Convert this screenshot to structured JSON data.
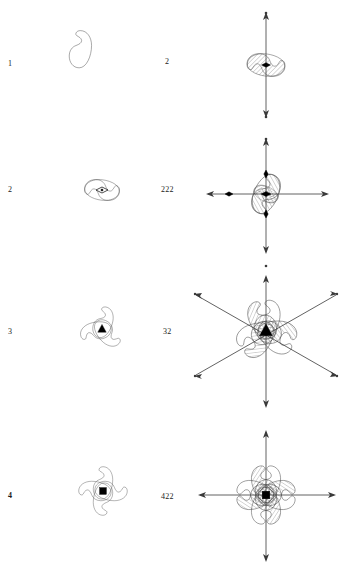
{
  "figure": {
    "title": "",
    "background_color": "#ffffff",
    "stroke_color": "#3a3a3a",
    "symbol_color": "#000000",
    "rows": [
      {
        "id": "row-1",
        "left": {
          "label": "1",
          "label_bold": false,
          "motif_count": 1,
          "symmetry_symbol": "none",
          "axis_symbol_name": "no-axis-symbol"
        },
        "right": {
          "label": "2",
          "label_bold": false,
          "motif_count": 2,
          "hatched_count": 1,
          "symmetry_symbol": "two-fold-lens",
          "axes": [
            "vertical"
          ],
          "axis_symbol_name": "two-fold-axis-arrow"
        }
      },
      {
        "id": "row-2",
        "left": {
          "label": "2",
          "label_bold": false,
          "motif_count": 2,
          "symmetry_symbol": "two-fold-lens",
          "axis_symbol_name": "two-fold-lens-symbol"
        },
        "right": {
          "label": "222",
          "label_bold": false,
          "motif_count": 4,
          "hatched_count": 2,
          "symmetry_symbol": "two-fold-lens",
          "axes": [
            "vertical",
            "horizontal",
            "perpendicular"
          ],
          "axis_symbol_name": "two-fold-axes-cross"
        }
      },
      {
        "id": "row-3",
        "left": {
          "label": "3",
          "label_bold": false,
          "motif_count": 3,
          "symmetry_symbol": "three-fold-triangle",
          "axis_symbol_name": "three-fold-triangle-symbol"
        },
        "right": {
          "label": "32",
          "label_bold": false,
          "motif_count": 6,
          "hatched_count": 3,
          "symmetry_symbol": "three-fold-triangle",
          "axes": [
            "vertical",
            "diagonal-up",
            "diagonal-down"
          ],
          "axis_symbol_name": "three-fold-triangle-with-two-fold-axes"
        }
      },
      {
        "id": "row-4",
        "left": {
          "label": "4",
          "label_bold": true,
          "motif_count": 4,
          "symmetry_symbol": "four-fold-square",
          "axis_symbol_name": "four-fold-square-symbol"
        },
        "right": {
          "label": "422",
          "label_bold": false,
          "motif_count": 8,
          "hatched_count": 4,
          "symmetry_symbol": "four-fold-square",
          "axes": [
            "vertical",
            "horizontal"
          ],
          "axis_symbol_name": "four-fold-square-with-two-fold-axes"
        }
      }
    ]
  }
}
